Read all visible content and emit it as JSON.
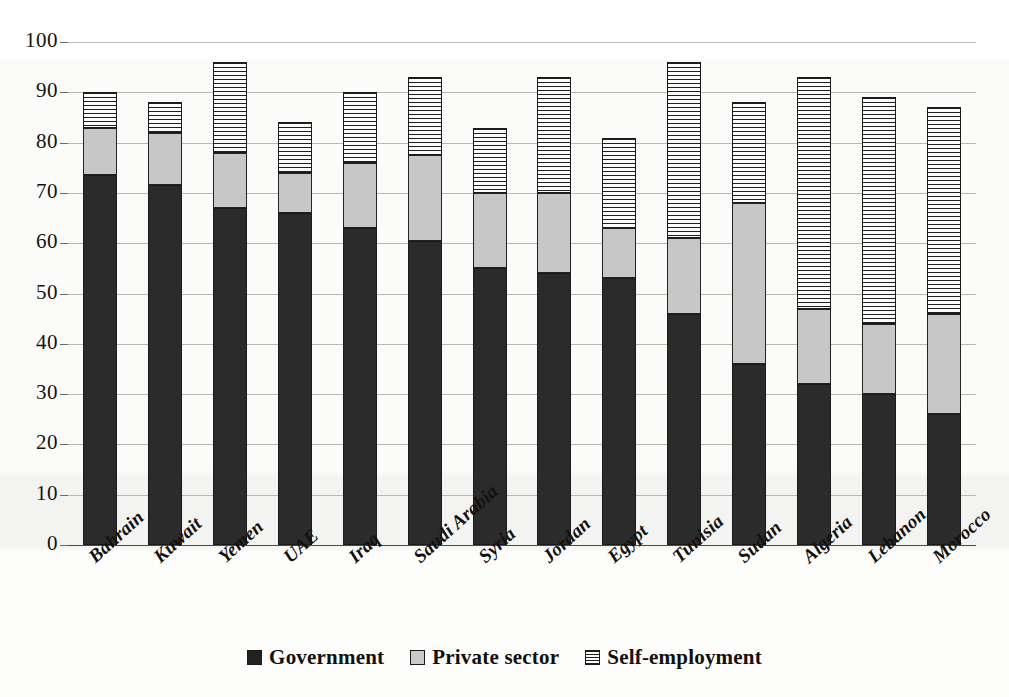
{
  "chart_data": {
    "type": "bar",
    "subtype": "stacked-vertical",
    "title": "",
    "xlabel": "",
    "ylabel": "",
    "ylim": [
      0,
      100
    ],
    "ytick_step": 10,
    "yticks": [
      100,
      90,
      80,
      70,
      60,
      50,
      40,
      30,
      20,
      10,
      0
    ],
    "grid": true,
    "grid_axis": "y",
    "legend_position": "bottom-center",
    "categories": [
      "Bahrain",
      "Kuwait",
      "Yemen",
      "UAE",
      "Iraq",
      "Saudi Arabia",
      "Syria",
      "Jordan",
      "Egypt",
      "Tunisia",
      "Sudan",
      "Algeria",
      "Lebanon",
      "Morocco"
    ],
    "series": [
      {
        "name": "Government",
        "color": "#2b2b2b",
        "pattern": "solid",
        "values": [
          73.5,
          71.5,
          67,
          66,
          63,
          60.5,
          55,
          54,
          53,
          46,
          36,
          32,
          30,
          26
        ]
      },
      {
        "name": "Private sector",
        "color": "#c7c7c7",
        "pattern": "solid-light",
        "values": [
          9.5,
          10.5,
          11,
          8,
          13,
          17,
          15,
          16,
          10,
          15,
          32,
          15,
          14,
          20
        ]
      },
      {
        "name": "Self-employment",
        "color": "#ffffff",
        "pattern": "horizontal-stripes",
        "values": [
          7,
          6,
          18,
          10,
          14,
          15.5,
          13,
          23,
          18,
          35,
          20,
          46,
          45,
          41
        ]
      }
    ],
    "totals": [
      90,
      88,
      96,
      84,
      90,
      93,
      83,
      93,
      81,
      96,
      88,
      93,
      89,
      87
    ]
  },
  "legend": {
    "items": [
      {
        "label": "Government",
        "swatch": "legend-swatch-government"
      },
      {
        "label": "Private sector",
        "swatch": "legend-swatch-private-sector"
      },
      {
        "label": "Self-employment",
        "swatch": "legend-swatch-self-employment"
      }
    ]
  },
  "colors": {
    "government": "#2b2b2b",
    "private_sector": "#c7c7c7",
    "self_employment": "#ffffff",
    "gridline": "#b9b9b4",
    "axis": "#4a4a4a",
    "text": "#14110e",
    "background": "#ffffff"
  }
}
